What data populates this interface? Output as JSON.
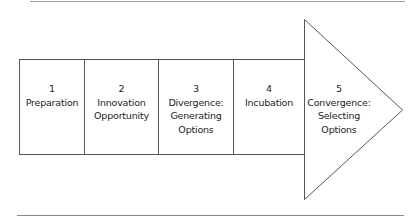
{
  "diagram": {
    "type": "process-arrow",
    "stroke_color": "#555555",
    "steps": [
      {
        "number": "1",
        "lines": [
          "Preparation"
        ]
      },
      {
        "number": "2",
        "lines": [
          "Innovation",
          "Opportunity"
        ]
      },
      {
        "number": "3",
        "lines": [
          "Divergence:",
          "Generating",
          "Options"
        ]
      },
      {
        "number": "4",
        "lines": [
          "Incubation"
        ]
      },
      {
        "number": "5",
        "lines": [
          "Convergence:",
          "Selecting",
          "Options"
        ]
      }
    ]
  }
}
